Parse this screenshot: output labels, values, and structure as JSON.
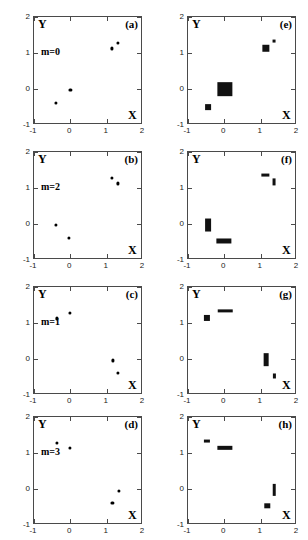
{
  "figure": {
    "columns": 2,
    "rows": 4,
    "axis_label_x": "X",
    "axis_label_y": "Y",
    "xticks": [
      "-1",
      "0",
      "1",
      "2"
    ],
    "yticks": [
      "2",
      "1",
      "0",
      "-1"
    ],
    "xtick_values": [
      -1,
      0,
      1,
      2
    ],
    "ytick_values": [
      2,
      1,
      0,
      -1
    ],
    "xlim": [
      -1,
      2
    ],
    "ylim": [
      -1,
      2
    ],
    "marker_color": "#000000"
  },
  "chart_data": {
    "type": "scatter",
    "title": "",
    "xlabel": "X",
    "ylabel": "Y",
    "xlim": [
      -1,
      2
    ],
    "ylim": [
      -1,
      2
    ],
    "xticks": [
      -1,
      0,
      1,
      2
    ],
    "yticks": [
      -1,
      0,
      1,
      2
    ],
    "grid": false,
    "legend": "none",
    "panels": [
      {
        "letter": "(a)",
        "annotation": "m=0",
        "marker": "point",
        "points": [
          {
            "x": -0.4,
            "y": -0.38,
            "w": 0.06,
            "h": 0.06
          },
          {
            "x": 0.0,
            "y": -0.02,
            "w": 0.06,
            "h": 0.06
          },
          {
            "x": 1.15,
            "y": 1.13,
            "w": 0.06,
            "h": 0.06
          },
          {
            "x": 1.3,
            "y": 1.27,
            "w": 0.06,
            "h": 0.06
          }
        ]
      },
      {
        "letter": "(e)",
        "annotation": "",
        "marker": "box",
        "points": [
          {
            "x": -0.45,
            "y": -0.5,
            "w": 0.16,
            "h": 0.16
          },
          {
            "x": 0.02,
            "y": 0.0,
            "w": 0.42,
            "h": 0.38
          },
          {
            "x": 1.15,
            "y": 1.13,
            "w": 0.2,
            "h": 0.18
          },
          {
            "x": 1.36,
            "y": 1.32,
            "w": 0.08,
            "h": 0.08
          }
        ]
      },
      {
        "letter": "(b)",
        "annotation": "m=2",
        "marker": "point",
        "points": [
          {
            "x": -0.4,
            "y": -0.02,
            "w": 0.06,
            "h": 0.06
          },
          {
            "x": -0.03,
            "y": -0.38,
            "w": 0.06,
            "h": 0.06
          },
          {
            "x": 1.15,
            "y": 1.27,
            "w": 0.06,
            "h": 0.06
          },
          {
            "x": 1.32,
            "y": 1.13,
            "w": 0.06,
            "h": 0.06
          }
        ]
      },
      {
        "letter": "(f)",
        "annotation": "",
        "marker": "box",
        "points": [
          {
            "x": -0.44,
            "y": -0.02,
            "w": 0.16,
            "h": 0.36
          },
          {
            "x": -0.02,
            "y": -0.47,
            "w": 0.42,
            "h": 0.14
          },
          {
            "x": 1.13,
            "y": 1.35,
            "w": 0.2,
            "h": 0.08
          },
          {
            "x": 1.38,
            "y": 1.16,
            "w": 0.08,
            "h": 0.2
          }
        ]
      },
      {
        "letter": "(c)",
        "annotation": "m=1",
        "marker": "point",
        "points": [
          {
            "x": -0.37,
            "y": 1.13,
            "w": 0.06,
            "h": 0.06
          },
          {
            "x": -0.02,
            "y": 1.27,
            "w": 0.06,
            "h": 0.06
          },
          {
            "x": 1.18,
            "y": -0.04,
            "w": 0.06,
            "h": 0.06
          },
          {
            "x": 1.32,
            "y": -0.38,
            "w": 0.06,
            "h": 0.06
          }
        ]
      },
      {
        "letter": "(g)",
        "annotation": "",
        "marker": "box",
        "points": [
          {
            "x": -0.47,
            "y": 1.13,
            "w": 0.17,
            "h": 0.17
          },
          {
            "x": 0.03,
            "y": 1.34,
            "w": 0.4,
            "h": 0.09
          },
          {
            "x": 1.15,
            "y": -0.02,
            "w": 0.13,
            "h": 0.38
          },
          {
            "x": 1.38,
            "y": -0.47,
            "w": 0.06,
            "h": 0.14
          }
        ]
      },
      {
        "letter": "(d)",
        "annotation": "m=3",
        "marker": "point",
        "points": [
          {
            "x": -0.38,
            "y": 1.28,
            "w": 0.06,
            "h": 0.06
          },
          {
            "x": -0.02,
            "y": 1.14,
            "w": 0.06,
            "h": 0.06
          },
          {
            "x": 1.16,
            "y": -0.38,
            "w": 0.06,
            "h": 0.06
          },
          {
            "x": 1.33,
            "y": -0.05,
            "w": 0.06,
            "h": 0.06
          }
        ]
      },
      {
        "letter": "(h)",
        "annotation": "",
        "marker": "box",
        "points": [
          {
            "x": -0.47,
            "y": 1.34,
            "w": 0.17,
            "h": 0.08
          },
          {
            "x": 0.02,
            "y": 1.14,
            "w": 0.42,
            "h": 0.12
          },
          {
            "x": 1.18,
            "y": -0.47,
            "w": 0.15,
            "h": 0.15
          },
          {
            "x": 1.38,
            "y": -0.02,
            "w": 0.07,
            "h": 0.34
          }
        ]
      }
    ]
  }
}
